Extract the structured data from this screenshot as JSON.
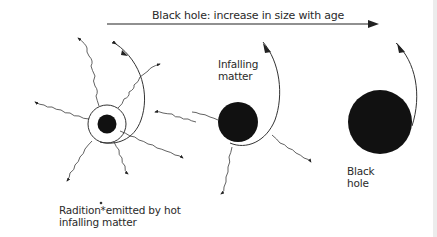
{
  "title": "Black hole: increase in size with age",
  "labels": {
    "infalling_line1": "Infalling",
    "infalling_line2": "matter",
    "blackhole_line1": "Black",
    "blackhole_line2": "hole",
    "radiation_line1": "Radition*emitted by hot",
    "radiation_line2": "infalling matter"
  },
  "stages": [
    {
      "name": "young",
      "core_radius": 9,
      "accretion_ring": true,
      "radiation_rays": 8
    },
    {
      "name": "middle",
      "core_radius": 20,
      "accretion_ring": false,
      "radiation_rays": 4
    },
    {
      "name": "old",
      "core_radius": 32,
      "accretion_ring": false,
      "radiation_rays": 0
    }
  ],
  "colors": {
    "ink": "#1a1a1a",
    "line": "#333333",
    "background": "#ffffff"
  }
}
